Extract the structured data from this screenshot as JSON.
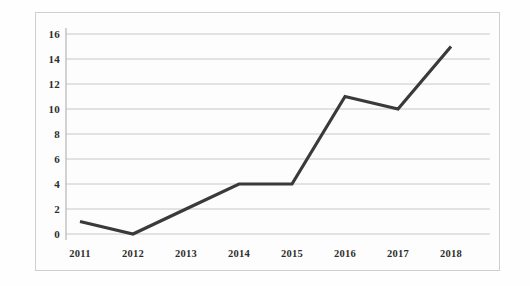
{
  "chart_data": {
    "type": "line",
    "title": "",
    "subtitle": "",
    "xlabel": "",
    "ylabel": "",
    "categories": [
      "2011",
      "2012",
      "2013",
      "2014",
      "2015",
      "2016",
      "2017",
      "2018"
    ],
    "values": [
      1,
      0,
      2,
      4,
      4,
      11,
      10,
      15
    ],
    "series": [
      {
        "name": "",
        "values": [
          1,
          0,
          2,
          4,
          4,
          11,
          10,
          15
        ]
      }
    ],
    "ylim": [
      0,
      16
    ],
    "xlim": [
      0,
      7
    ],
    "ytick_labels": [
      "16",
      "14",
      "12",
      "10",
      "8",
      "6",
      "4",
      "2",
      "0"
    ],
    "ytick_values": [
      16,
      14,
      12,
      10,
      8,
      6,
      4,
      2,
      0
    ],
    "xtick_labels": [
      "2011",
      "2012",
      "2013",
      "2014",
      "2015",
      "2016",
      "2017",
      "2018"
    ],
    "grid": true,
    "grid_axis": "y",
    "legend": false,
    "legend_position": "none",
    "markers": false,
    "annotations": [],
    "colors": {
      "line": "#3a3a3a",
      "grid": "#c8c8c8",
      "axis": "#b0b0b0",
      "text": "#2e2e2e",
      "background": "#fdfdfd",
      "border": "#cfcfcf"
    }
  }
}
